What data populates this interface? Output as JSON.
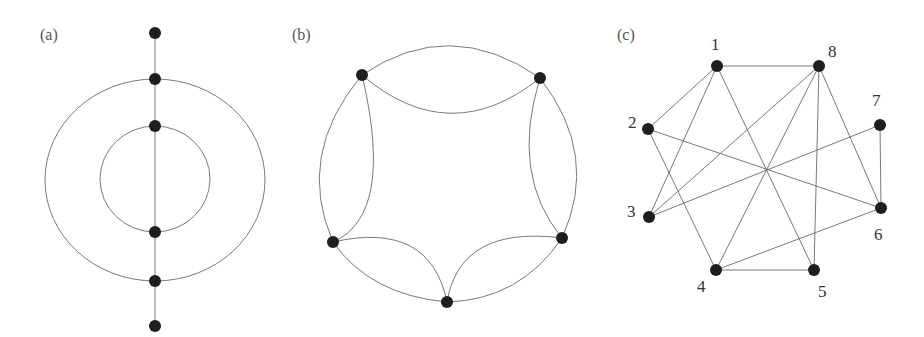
{
  "panels": [
    {
      "id": "a",
      "label": "(a)"
    },
    {
      "id": "b",
      "label": "(b)"
    },
    {
      "id": "c",
      "label": "(c)"
    }
  ],
  "graph_c": {
    "node_labels": [
      "1",
      "2",
      "3",
      "4",
      "5",
      "6",
      "7",
      "8"
    ],
    "edges": [
      [
        1,
        8
      ],
      [
        1,
        2
      ],
      [
        1,
        3
      ],
      [
        1,
        5
      ],
      [
        2,
        4
      ],
      [
        2,
        6
      ],
      [
        3,
        8
      ],
      [
        3,
        7
      ],
      [
        4,
        8
      ],
      [
        4,
        5
      ],
      [
        4,
        6
      ],
      [
        5,
        8
      ],
      [
        6,
        8
      ],
      [
        6,
        7
      ]
    ]
  },
  "graph_a": {
    "node_count": 6
  },
  "graph_b": {
    "node_count": 5
  }
}
